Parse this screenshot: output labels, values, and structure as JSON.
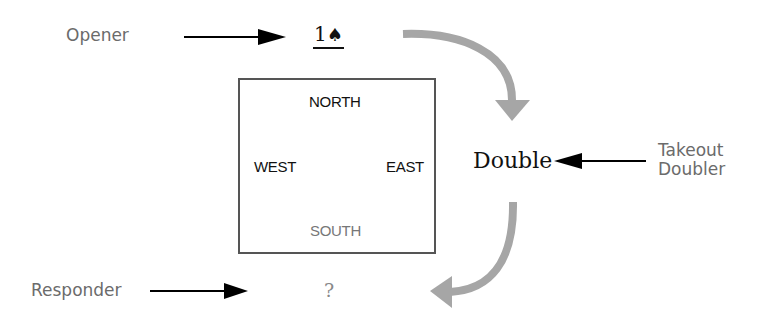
{
  "diagram": {
    "labels": {
      "opener": "Opener",
      "takeout_doubler_line1": "Takeout",
      "takeout_doubler_line2": "Doubler",
      "responder": "Responder"
    },
    "bids": {
      "opening_bid_level": "1",
      "opening_bid_suit": "♠",
      "double": "Double",
      "response": "?"
    },
    "table": {
      "north": "NORTH",
      "west": "WEST",
      "east": "EAST",
      "south": "SOUTH"
    },
    "colors": {
      "label_gray": "#6b6b6b",
      "curved_arrow_gray": "#a6a6a6",
      "straight_arrow": "#000000",
      "box_border": "#555555"
    }
  }
}
